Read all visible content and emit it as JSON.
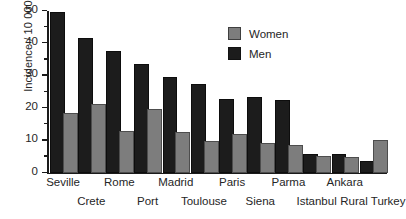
{
  "chart_data": {
    "type": "bar",
    "title": "",
    "xlabel": "",
    "ylabel": "Incidence / 10 000",
    "ylim": [
      0,
      50
    ],
    "yticks": [
      0,
      10,
      20,
      30,
      40,
      50
    ],
    "ytick_labels": [
      "0",
      "10",
      "20",
      "30",
      "40",
      "50"
    ],
    "grid": false,
    "legend_position": "top-right",
    "categories": [
      "Seville",
      "Crete",
      "Rome",
      "Port",
      "Madrid",
      "Toulouse",
      "Paris",
      "Siena",
      "Parma",
      "Istanbul",
      "Ankara",
      "Rural Turkey"
    ],
    "series": [
      {
        "name": "Men",
        "color": "#1c1c1c",
        "values": [
          49.0,
          41.0,
          37.0,
          33.0,
          29.0,
          27.0,
          22.2,
          22.8,
          21.8,
          5.4,
          5.3,
          3.0
        ]
      },
      {
        "name": "Women",
        "color": "#7d7d7d",
        "values": [
          18.0,
          20.8,
          12.5,
          19.0,
          12.0,
          9.4,
          11.4,
          8.7,
          8.1,
          4.6,
          4.2,
          9.6
        ]
      }
    ]
  },
  "legend": {
    "entries": [
      {
        "label": "Women",
        "swatch": "women-swatch"
      },
      {
        "label": "Men",
        "swatch": "men-swatch"
      }
    ]
  },
  "axes": {
    "y_title": "Incidence / 10 000"
  }
}
